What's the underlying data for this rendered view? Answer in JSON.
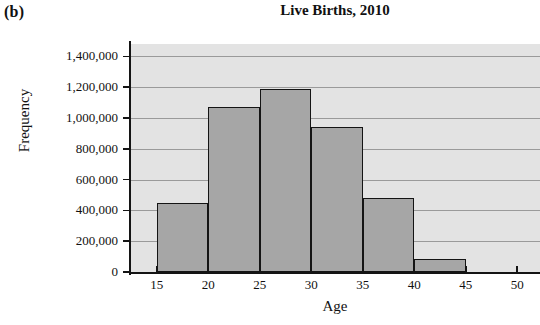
{
  "panel": {
    "label": "(b)"
  },
  "chart_data": {
    "type": "bar",
    "title": "Live Births, 2010",
    "xlabel": "Age",
    "ylabel": "Frequency",
    "categories": [
      "15-20",
      "20-25",
      "25-30",
      "30-35",
      "35-40",
      "40-45"
    ],
    "bin_edges": [
      15,
      20,
      25,
      30,
      35,
      40,
      45
    ],
    "values": [
      445000,
      1070000,
      1190000,
      940000,
      480000,
      85000
    ],
    "xlim": [
      12.5,
      52.2
    ],
    "ylim": [
      0,
      1480000
    ],
    "xticks": [
      15,
      20,
      25,
      30,
      35,
      40,
      45,
      50
    ],
    "xtick_labels": [
      "15",
      "20",
      "25",
      "30",
      "35",
      "40",
      "45",
      "50"
    ],
    "yticks": [
      0,
      200000,
      400000,
      600000,
      800000,
      1000000,
      1200000,
      1400000
    ],
    "ytick_labels": [
      "0",
      "200,000",
      "400,000",
      "600,000",
      "800,000",
      "1,000,000",
      "1,200,000",
      "1,400,000"
    ],
    "grid": true,
    "grid_axis": "y",
    "legend": false,
    "bar_fill": "#a6a6a6",
    "bar_edge": "#141414",
    "plot_background": "#e3e3e3"
  }
}
